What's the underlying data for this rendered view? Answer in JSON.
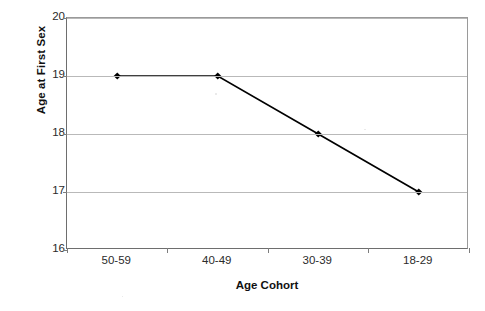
{
  "chart_data": {
    "type": "line",
    "title": "",
    "subtitle": "",
    "xlabel": "Age Cohort",
    "ylabel": "Age at First Sex",
    "categories": [
      "50-59",
      "40-49",
      "30-39",
      "18-29"
    ],
    "values": [
      19,
      19,
      18,
      17
    ],
    "series": [
      {
        "name": "Age at First Sex",
        "values": [
          19,
          19,
          18,
          17
        ]
      }
    ],
    "ylim": [
      16,
      20
    ],
    "yticks": [
      16,
      17,
      18,
      19,
      20
    ],
    "ytick_labels": [
      "16",
      "17",
      "18",
      "19",
      "20"
    ],
    "grid": true,
    "grid_axis": "y",
    "legend": false,
    "legend_position": "none",
    "marker": "diamond",
    "marker_color": "#000000",
    "line_color": "#000000",
    "gridline_color": "#b9b9b9",
    "axis_color": "#6e6e6e",
    "plot_background": "#ffffff",
    "annotations": []
  },
  "axes": {
    "y_title": "Age at First Sex",
    "x_title": "Age Cohort",
    "y_tick_labels": [
      "20",
      "19",
      "18",
      "17",
      "16"
    ],
    "x_tick_labels": [
      "50-59",
      "40-49",
      "30-39",
      "18-29"
    ]
  }
}
